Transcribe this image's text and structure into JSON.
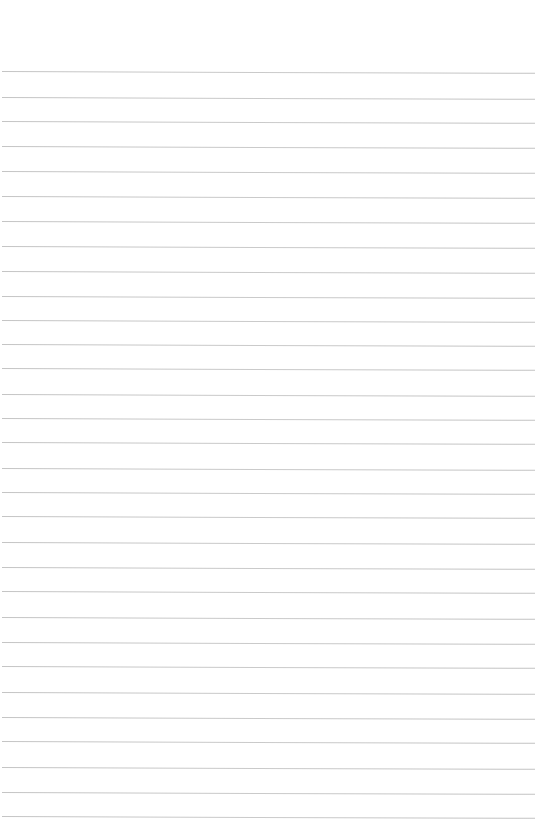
{
  "page": {
    "type": "lined-paper",
    "background_color": "#ffffff",
    "rule_color": "#c6c6c6",
    "rules": [
      71,
      97,
      121,
      146,
      171,
      196,
      221,
      246,
      271,
      296,
      320,
      344,
      368,
      394,
      418,
      442,
      468,
      492,
      516,
      542,
      567,
      591,
      617,
      642,
      666,
      692,
      717,
      741,
      767,
      792,
      816
    ]
  }
}
